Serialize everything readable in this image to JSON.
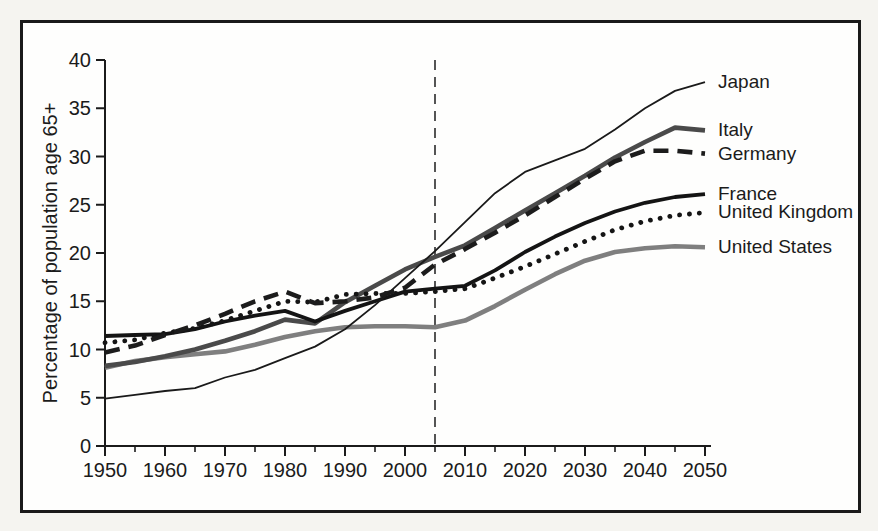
{
  "figure": {
    "outside_background": "#f5f4f0",
    "plot_background": "#fefefd",
    "frame_border_color": "#1a1a1a",
    "axis_color": "#1b1b1b"
  },
  "chart_data": {
    "type": "line",
    "title": "",
    "xlabel": "",
    "ylabel": "Percentage of population age 65+",
    "xlim": [
      1950,
      2050
    ],
    "ylim": [
      0,
      40
    ],
    "x_major_ticks": [
      1950,
      1960,
      1970,
      1980,
      1990,
      2000,
      2010,
      2020,
      2030,
      2040,
      2050
    ],
    "x_minor_ticks": [
      1955,
      1965,
      1975,
      1985,
      1995,
      2005,
      2015,
      2025,
      2035,
      2045
    ],
    "y_ticks": [
      0,
      5,
      10,
      15,
      20,
      25,
      30,
      35,
      40
    ],
    "grid": false,
    "legend_position": "labels at right ends of lines",
    "projection_divider": {
      "x": 2005,
      "style": "dashed vertical line",
      "color": "#2b2b2b"
    },
    "x": [
      1950,
      1955,
      1960,
      1965,
      1970,
      1975,
      1980,
      1985,
      1990,
      1995,
      2000,
      2005,
      2010,
      2015,
      2020,
      2025,
      2030,
      2035,
      2040,
      2045,
      2050
    ],
    "series": [
      {
        "name": "Japan",
        "color": "#1a1a1a",
        "line_style": "thin-solid",
        "values": [
          4.9,
          5.3,
          5.7,
          6.0,
          7.1,
          7.9,
          9.1,
          10.3,
          12.1,
          14.6,
          17.4,
          20.2,
          23.2,
          26.2,
          28.4,
          29.6,
          30.8,
          32.8,
          35.0,
          36.8,
          37.7
        ]
      },
      {
        "name": "Italy",
        "color": "#4a4a4a",
        "line_style": "thick-solid",
        "values": [
          8.3,
          8.7,
          9.3,
          10.0,
          10.9,
          11.9,
          13.1,
          12.7,
          14.9,
          16.6,
          18.3,
          19.6,
          20.8,
          22.6,
          24.4,
          26.2,
          28.0,
          29.9,
          31.5,
          33.0,
          32.7
        ]
      },
      {
        "name": "Germany",
        "color": "#1c1c1c",
        "line_style": "dashed",
        "values": [
          9.7,
          10.4,
          11.5,
          12.5,
          13.7,
          15.0,
          16.0,
          14.8,
          15.0,
          15.4,
          16.4,
          18.8,
          20.4,
          22.1,
          23.9,
          25.8,
          27.7,
          29.5,
          30.6,
          30.6,
          30.3
        ]
      },
      {
        "name": "France",
        "color": "#141414",
        "line_style": "medium-solid",
        "values": [
          11.4,
          11.5,
          11.6,
          12.1,
          12.9,
          13.5,
          14.0,
          12.9,
          14.0,
          15.0,
          16.0,
          16.3,
          16.6,
          18.2,
          20.1,
          21.7,
          23.1,
          24.3,
          25.2,
          25.8,
          26.1
        ]
      },
      {
        "name": "United Kingdom",
        "color": "#151515",
        "line_style": "dotted",
        "values": [
          10.7,
          11.0,
          11.7,
          12.2,
          13.0,
          14.0,
          15.0,
          14.9,
          15.7,
          15.8,
          15.8,
          16.0,
          16.3,
          17.4,
          18.6,
          19.9,
          21.2,
          22.4,
          23.3,
          23.9,
          24.2
        ]
      },
      {
        "name": "United States",
        "color": "#7f7f7f",
        "line_style": "thick-solid",
        "values": [
          8.1,
          8.8,
          9.2,
          9.5,
          9.8,
          10.5,
          11.3,
          11.9,
          12.3,
          12.4,
          12.4,
          12.3,
          13.0,
          14.5,
          16.2,
          17.8,
          19.2,
          20.1,
          20.5,
          20.7,
          20.6
        ]
      }
    ]
  }
}
